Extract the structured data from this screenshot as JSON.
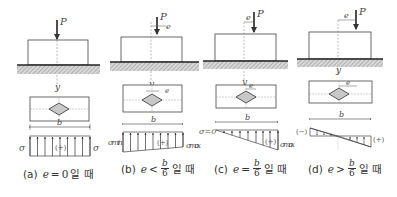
{
  "figure": {
    "panels": [
      {
        "id": "a",
        "load_label": "P",
        "axis_label": "y",
        "width_label": "b",
        "eccentricity_label": "",
        "stress_left_label": "σ",
        "stress_right_label": "σ",
        "sign_label": "(+)",
        "caption": {
          "tag": "(a)",
          "var": "e",
          "op": "=",
          "rhs": "0",
          "suffix": "일 때"
        }
      },
      {
        "id": "b",
        "load_label": "P",
        "axis_label": "y",
        "width_label": "b",
        "eccentricity_label": "e",
        "stress_left_label": "σmin",
        "stress_right_label": "σmax",
        "sign_label": "(+)",
        "caption": {
          "tag": "(b)",
          "var": "e",
          "op": "<",
          "num": "b",
          "den": "6",
          "suffix": "일 때"
        }
      },
      {
        "id": "c",
        "load_label": "P",
        "axis_label": "y",
        "width_label": "b",
        "eccentricity_label": "e",
        "stress_left_label": "σ=0",
        "stress_right_label": "σmax",
        "sign_label": "(+)",
        "caption": {
          "tag": "(c)",
          "var": "e",
          "op": "=",
          "num": "b",
          "den": "6",
          "suffix": "일 때"
        }
      },
      {
        "id": "d",
        "load_label": "P",
        "axis_label": "y",
        "width_label": "b",
        "eccentricity_label": "e",
        "stress_left_label": "(−)",
        "stress_right_label": "(+)",
        "sign_label": "",
        "caption": {
          "tag": "(d)",
          "var": "e",
          "op": ">",
          "num": "b",
          "den": "6",
          "suffix": "일 때"
        }
      }
    ]
  },
  "colors": {
    "line": "#333333",
    "hatch": "#9a9a9a",
    "ground": "#222222"
  }
}
